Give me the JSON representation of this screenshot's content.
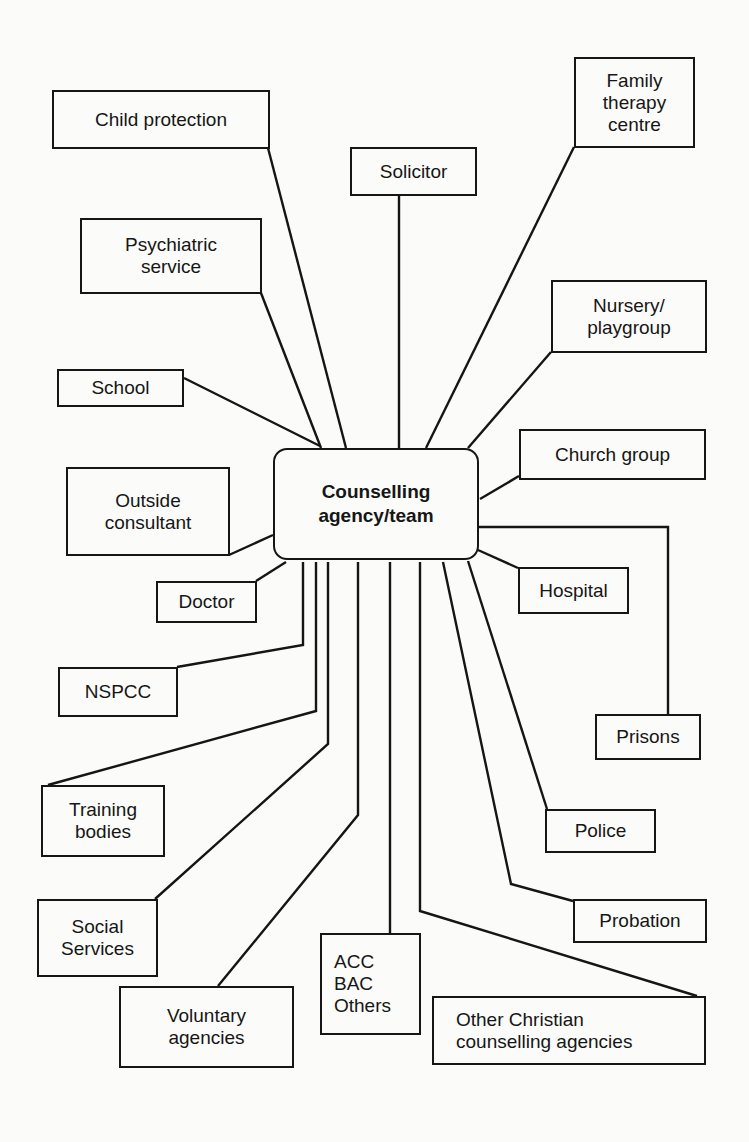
{
  "diagram": {
    "center": {
      "id": "counselling-agency",
      "label": "Counselling\nagency/team",
      "box": [
        273,
        448,
        206,
        112
      ]
    },
    "nodes": [
      {
        "id": "child-protection",
        "label": "Child protection",
        "box": [
          52,
          90,
          218,
          59
        ]
      },
      {
        "id": "solicitor",
        "label": "Solicitor",
        "box": [
          350,
          147,
          127,
          49
        ]
      },
      {
        "id": "family-therapy-centre",
        "label": "Family\ntherapy\ncentre",
        "box": [
          574,
          57,
          121,
          91
        ]
      },
      {
        "id": "psychiatric-service",
        "label": "Psychiatric\nservice",
        "box": [
          80,
          218,
          182,
          76
        ]
      },
      {
        "id": "nursery-playgroup",
        "label": "Nursery/\nplaygroup",
        "box": [
          551,
          280,
          156,
          73
        ]
      },
      {
        "id": "school",
        "label": "School",
        "box": [
          57,
          369,
          127,
          38
        ]
      },
      {
        "id": "church-group",
        "label": "Church group",
        "box": [
          519,
          429,
          187,
          51
        ]
      },
      {
        "id": "outside-consultant",
        "label": "Outside\nconsultant",
        "box": [
          66,
          467,
          164,
          89
        ]
      },
      {
        "id": "hospital",
        "label": "Hospital",
        "box": [
          518,
          567,
          111,
          47
        ]
      },
      {
        "id": "doctor",
        "label": "Doctor",
        "box": [
          156,
          581,
          101,
          42
        ]
      },
      {
        "id": "nspcc",
        "label": "NSPCC",
        "box": [
          58,
          667,
          120,
          50
        ]
      },
      {
        "id": "prisons",
        "label": "Prisons",
        "box": [
          595,
          714,
          106,
          46
        ]
      },
      {
        "id": "training-bodies",
        "label": "Training\nbodies",
        "box": [
          41,
          785,
          124,
          72
        ]
      },
      {
        "id": "police",
        "label": "Police",
        "box": [
          545,
          809,
          111,
          44
        ]
      },
      {
        "id": "probation",
        "label": "Probation",
        "box": [
          573,
          899,
          134,
          44
        ]
      },
      {
        "id": "social-services",
        "label": "Social\nServices",
        "box": [
          37,
          899,
          121,
          78
        ]
      },
      {
        "id": "acc-bac-others",
        "label": "ACC\nBAC\nOthers",
        "box": [
          320,
          933,
          101,
          102
        ],
        "align": "left"
      },
      {
        "id": "voluntary-agencies",
        "label": "Voluntary\nagencies",
        "box": [
          119,
          986,
          175,
          82
        ]
      },
      {
        "id": "other-christian-counselling-agencies",
        "label": "Other Christian\ncounselling agencies",
        "box": [
          432,
          996,
          274,
          69
        ],
        "align": "left-wide"
      }
    ],
    "links": [
      {
        "to": "child-protection",
        "points": [
          [
            268,
            148
          ],
          [
            346,
            448
          ]
        ]
      },
      {
        "to": "solicitor",
        "points": [
          [
            399,
            196
          ],
          [
            399,
            448
          ]
        ]
      },
      {
        "to": "family-therapy-centre",
        "points": [
          [
            574,
            147
          ],
          [
            426,
            448
          ]
        ]
      },
      {
        "to": "psychiatric-service",
        "points": [
          [
            261,
            293
          ],
          [
            321,
            448
          ]
        ]
      },
      {
        "to": "nursery-playgroup",
        "points": [
          [
            551,
            352
          ],
          [
            468,
            448
          ]
        ]
      },
      {
        "to": "school",
        "points": [
          [
            184,
            378
          ],
          [
            320,
            446
          ]
        ]
      },
      {
        "to": "church-group",
        "points": [
          [
            519,
            476
          ],
          [
            480,
            499
          ]
        ]
      },
      {
        "to": "outside-consultant",
        "points": [
          [
            229,
            555
          ],
          [
            273,
            535
          ]
        ]
      },
      {
        "to": "prisons",
        "points": [
          [
            479,
            527
          ],
          [
            668,
            527
          ],
          [
            668,
            714
          ]
        ]
      },
      {
        "to": "hospital",
        "points": [
          [
            478,
            550
          ],
          [
            518,
            568
          ]
        ]
      },
      {
        "to": "doctor",
        "points": [
          [
            256,
            581
          ],
          [
            286,
            562
          ]
        ]
      },
      {
        "to": "nspcc",
        "points": [
          [
            303,
            562
          ],
          [
            303,
            645
          ],
          [
            177,
            667
          ]
        ]
      },
      {
        "to": "training-bodies",
        "points": [
          [
            316,
            562
          ],
          [
            316,
            711
          ],
          [
            48,
            785
          ]
        ]
      },
      {
        "to": "social-services",
        "points": [
          [
            328,
            562
          ],
          [
            328,
            744
          ],
          [
            155,
            899
          ]
        ]
      },
      {
        "to": "voluntary-agencies",
        "points": [
          [
            358,
            562
          ],
          [
            358,
            815
          ],
          [
            218,
            986
          ]
        ]
      },
      {
        "to": "acc-bac-others",
        "points": [
          [
            390,
            562
          ],
          [
            390,
            933
          ]
        ]
      },
      {
        "to": "other-christian-counselling-agencies",
        "points": [
          [
            420,
            562
          ],
          [
            420,
            911
          ],
          [
            697,
            996
          ]
        ]
      },
      {
        "to": "probation",
        "points": [
          [
            443,
            562
          ],
          [
            511,
            884
          ],
          [
            573,
            901
          ]
        ]
      },
      {
        "to": "police",
        "points": [
          [
            468,
            561
          ],
          [
            547,
            809
          ]
        ]
      }
    ]
  }
}
